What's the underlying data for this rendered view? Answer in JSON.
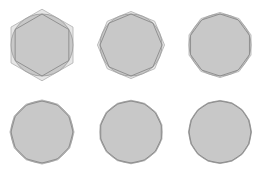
{
  "diagram": {
    "colors": {
      "background": "#ffffff",
      "circle_fill": "#c8c8c8",
      "circle_stroke": "#9a9a9a",
      "inscribed_stroke": "#8a8a8a",
      "circumscribed_stroke": "#b0b0b0"
    },
    "panels": [
      {
        "id": "panel-1",
        "cx": 42,
        "cy": 45,
        "r": 31,
        "sides": 6
      },
      {
        "id": "panel-2",
        "cx": 131,
        "cy": 45,
        "r": 31,
        "sides": 8
      },
      {
        "id": "panel-3",
        "cx": 220,
        "cy": 45,
        "r": 31,
        "sides": 10
      },
      {
        "id": "panel-4",
        "cx": 42,
        "cy": 132,
        "r": 31,
        "sides": 12
      },
      {
        "id": "panel-5",
        "cx": 131,
        "cy": 132,
        "r": 31,
        "sides": 14
      },
      {
        "id": "panel-6",
        "cx": 220,
        "cy": 132,
        "r": 31,
        "sides": 16
      }
    ]
  }
}
